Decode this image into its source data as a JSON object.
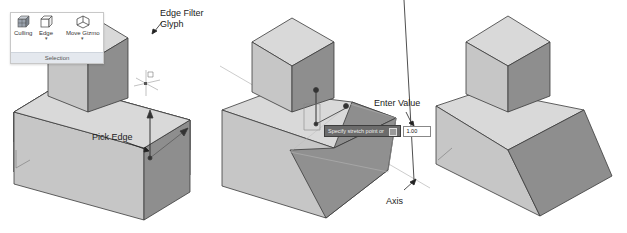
{
  "ribbon": {
    "tools": [
      {
        "label": "Culling",
        "icon": "culling-icon"
      },
      {
        "label": "Edge",
        "icon": "edge-cube-icon",
        "has_dropdown": true
      },
      {
        "label": "Move Gizmo",
        "icon": "move-gizmo-icon",
        "has_dropdown": true
      }
    ],
    "panel_title": "Selection"
  },
  "callouts": {
    "edge_filter_glyph_line1": "Edge Filter",
    "edge_filter_glyph_line2": "Glyph",
    "pick_edge": "Pick Edge",
    "enter_value": "Enter Value",
    "axis": "Axis"
  },
  "command_prompt": {
    "text": "Specify stretch point or",
    "value": "1.00"
  },
  "colors": {
    "top_face": "#d9d9d9",
    "left_face": "#c6c6c6",
    "right_face": "#8e8e8e",
    "edge": "#3a3a3a",
    "panel_title_bg": "#e4e8ee"
  }
}
